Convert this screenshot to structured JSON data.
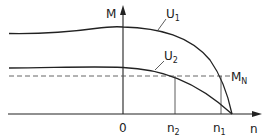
{
  "diagram": {
    "axes": {
      "y_label": "M",
      "x_label": "n",
      "origin_label": "0"
    },
    "curves": [
      {
        "name": "U1",
        "label_main": "U",
        "label_sub": "1"
      },
      {
        "name": "U2",
        "label_main": "U",
        "label_sub": "2"
      }
    ],
    "reference_line": {
      "label_main": "M",
      "label_sub": "N",
      "style": "dashed"
    },
    "x_markers": [
      {
        "label_main": "n",
        "label_sub": "2"
      },
      {
        "label_main": "n",
        "label_sub": "1"
      }
    ],
    "colors": {
      "line": "#222222",
      "dashed": "#555555",
      "background": "#ffffff"
    }
  }
}
